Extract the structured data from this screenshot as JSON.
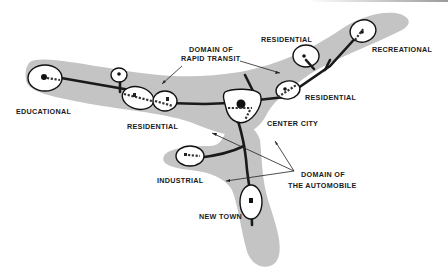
{
  "diagram": {
    "title": "",
    "labels": {
      "educational": "EDUCATIONAL",
      "residential_west": "RESIDENTIAL",
      "domain_rapid_transit_line1": "DOMAIN OF",
      "domain_rapid_transit_line2": "RAPID TRANSIT",
      "residential_north": "RESIDENTIAL",
      "recreational": "RECREATIONAL",
      "residential_east": "RESIDENTIAL",
      "center_city": "CENTER CITY",
      "industrial": "INDUSTRIAL",
      "domain_automobile_line1": "DOMAIN OF",
      "domain_automobile_line2": "THE AUTOMOBILE",
      "new_town": "NEW TOWN"
    },
    "colors": {
      "domain_fill": "#c4c4c4",
      "node_fill": "#ffffff",
      "line": "#1a1a1a"
    },
    "nodes": [
      {
        "id": "educational",
        "label": "EDUCATIONAL"
      },
      {
        "id": "residential-small-west",
        "label": ""
      },
      {
        "id": "residential-west-1",
        "label": "RESIDENTIAL"
      },
      {
        "id": "residential-west-2",
        "label": "RESIDENTIAL"
      },
      {
        "id": "center-city",
        "label": "CENTER CITY"
      },
      {
        "id": "residential-east",
        "label": "RESIDENTIAL"
      },
      {
        "id": "residential-north",
        "label": "RESIDENTIAL"
      },
      {
        "id": "recreational",
        "label": "RECREATIONAL"
      },
      {
        "id": "industrial",
        "label": "INDUSTRIAL"
      },
      {
        "id": "new-town",
        "label": "NEW TOWN"
      }
    ]
  }
}
